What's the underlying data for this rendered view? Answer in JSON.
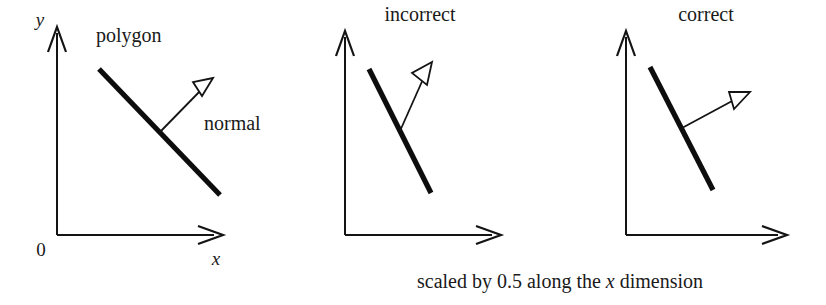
{
  "figure": {
    "background_color": "#ffffff",
    "ink_color": "#141414",
    "caption": {
      "prefix": "scaled by 0.5 along the ",
      "variable": "x",
      "suffix": " dimension",
      "full_text": "scaled by 0.5 along the x dimension"
    },
    "panels": [
      {
        "id": "original",
        "title": "",
        "axis_labels": {
          "x": "x",
          "y": "y",
          "origin": "0"
        },
        "annotations": {
          "polygon": "polygon",
          "normal": "normal"
        },
        "geometry": {
          "origin": [
            57,
            235
          ],
          "y_axis_tip": [
            57,
            27
          ],
          "x_axis_tip": [
            222,
            235
          ],
          "polygon_start": [
            99,
            69
          ],
          "polygon_end": [
            220,
            195
          ],
          "normal_base": [
            160,
            132
          ],
          "normal_tip": [
            213,
            78
          ]
        }
      },
      {
        "id": "incorrect",
        "title": "incorrect",
        "axis_labels": {
          "x": "",
          "y": "",
          "origin": ""
        },
        "annotations": {
          "polygon": "",
          "normal": ""
        },
        "geometry": {
          "origin": [
            345,
            235
          ],
          "y_axis_tip": [
            345,
            31
          ],
          "x_axis_tip": [
            500,
            235
          ],
          "polygon_start": [
            369,
            69
          ],
          "polygon_end": [
            431,
            193
          ],
          "normal_base": [
            400,
            131
          ],
          "normal_tip": [
            432,
            62
          ]
        }
      },
      {
        "id": "correct",
        "title": "correct",
        "axis_labels": {
          "x": "",
          "y": "",
          "origin": ""
        },
        "annotations": {
          "polygon": "",
          "normal": ""
        },
        "geometry": {
          "origin": [
            626,
            235
          ],
          "y_axis_tip": [
            626,
            31
          ],
          "x_axis_tip": [
            786,
            235
          ],
          "polygon_start": [
            650,
            67
          ],
          "polygon_end": [
            713,
            190
          ],
          "normal_base": [
            682,
            128
          ],
          "normal_tip": [
            750,
            92
          ]
        }
      }
    ],
    "label_positions": {
      "panel1_y": [
        40,
        26
      ],
      "panel1_x": [
        216,
        265
      ],
      "panel1_origin": [
        41,
        256
      ],
      "panel1_polygon": [
        96,
        42
      ],
      "panel1_normal": [
        204,
        130
      ],
      "panel2_title": [
        374,
        21
      ],
      "panel3_title": [
        665,
        21
      ],
      "caption": [
        417,
        283
      ]
    }
  }
}
